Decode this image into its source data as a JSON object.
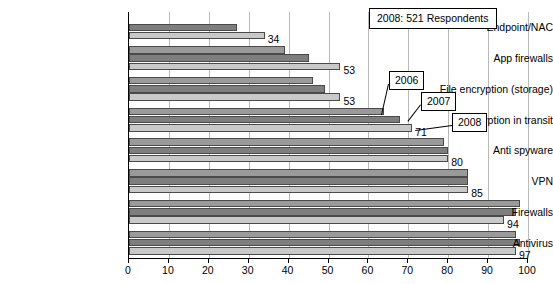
{
  "chart_data": {
    "type": "bar",
    "orientation": "horizontal",
    "title": "",
    "xlabel": "",
    "ylabel": "",
    "xlim": [
      0,
      100
    ],
    "xticks": [
      0,
      10,
      20,
      30,
      40,
      50,
      60,
      70,
      80,
      90,
      100
    ],
    "grid": true,
    "legend_position": "callouts",
    "categories": [
      "Endpoint/NAC",
      "App firewalls",
      "File encryption (storage)",
      "Encryption in transit",
      "Anti spyware",
      "VPN",
      "Firewalls",
      "Antivirus"
    ],
    "series": [
      {
        "name": "2006",
        "color": "#9a9a9a",
        "values": [
          null,
          39,
          46,
          64,
          79,
          85,
          98,
          97
        ]
      },
      {
        "name": "2007",
        "color": "#7e7e7e",
        "values": [
          27,
          45,
          49,
          68,
          80,
          85,
          97,
          98
        ]
      },
      {
        "name": "2008",
        "color": "#c9c9c9",
        "values": [
          34,
          53,
          53,
          71,
          80,
          85,
          94,
          97
        ]
      }
    ],
    "data_labels": {
      "Endpoint/NAC": "34",
      "App firewalls": "53",
      "File encryption (storage)": "53",
      "Encryption in transit": "71",
      "Anti spyware": "80",
      "VPN": "85",
      "Firewalls": "94",
      "Antivirus": "97"
    },
    "annotations": [
      {
        "name": "respondents-note",
        "text": "2008: 521 Respondents"
      },
      {
        "name": "series-callout-2006",
        "text": "2006"
      },
      {
        "name": "series-callout-2007",
        "text": "2007"
      },
      {
        "name": "series-callout-2008",
        "text": "2008"
      }
    ]
  },
  "axis": {
    "xticks": [
      "0",
      "10",
      "20",
      "30",
      "40",
      "50",
      "60",
      "70",
      "80",
      "90",
      "100"
    ]
  }
}
